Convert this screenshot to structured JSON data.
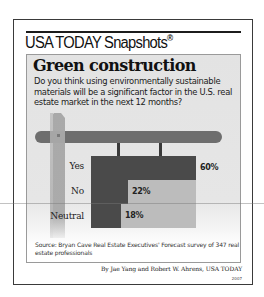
{
  "header": {
    "brand": "USA TODAY Snapshots",
    "registered_mark": "®"
  },
  "graphic": {
    "title": "Green construction",
    "question": "Do you think using environmentally sustainable materials will be a significant factor in the U.S. real estate market in the next 12 months?"
  },
  "chart_data": {
    "type": "bar",
    "orientation": "horizontal",
    "title": "Green construction",
    "subtitle": "Do you think using environmentally sustainable materials will be a significant factor in the U.S. real estate market in the next 12 months?",
    "categories": [
      "Yes",
      "No",
      "Neutral"
    ],
    "values": [
      60,
      22,
      18
    ],
    "value_labels": [
      "60%",
      "22%",
      "18%"
    ],
    "unit": "%",
    "xlabel": "",
    "ylabel": "",
    "grid": false,
    "legend": null,
    "colors": {
      "bar": "#4a4a4a",
      "board": "#bcbcbc",
      "post": "#a9a9a9",
      "crossbar": "#6e6e6e"
    }
  },
  "footer": {
    "source": "Source: Bryan Cave Real Estate Executives' Forecast survey of 347 real estate professionals",
    "byline": "By Jae Yang and Robert W. Ahrens, USA TODAY",
    "year": "2007"
  }
}
